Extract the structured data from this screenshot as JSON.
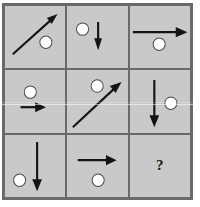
{
  "puzzle": {
    "type": "ravens-progressive-matrix",
    "title": "3x3 visual analogy matrix",
    "rows": 3,
    "columns": 3,
    "background_color": "#c9c9c9",
    "grid_line_color": "#6a6a6a",
    "stroke_color": "#141414",
    "circle_fill_color": "#ffffff",
    "missing_cell_index": 9,
    "missing_cell_label": "?",
    "cells": [
      {
        "index": 1,
        "name": "cell-1",
        "arrow": {
          "direction": "up-right",
          "length": "long",
          "x1": 8,
          "y1": 48,
          "x2": 52,
          "y2": 10
        },
        "circle": {
          "cx": 42,
          "cy": 36,
          "r": 6,
          "position": "lower-right-of-arrow"
        }
      },
      {
        "index": 2,
        "name": "cell-2",
        "arrow": {
          "direction": "down",
          "length": "short",
          "x1": 32,
          "y1": 17,
          "x2": 32,
          "y2": 41
        },
        "circle": {
          "cx": 17,
          "cy": 23,
          "r": 6,
          "position": "left-of-arrow"
        }
      },
      {
        "index": 3,
        "name": "cell-3",
        "arrow": {
          "direction": "right",
          "length": "long",
          "x1": 4,
          "y1": 26,
          "x2": 58,
          "y2": 26
        },
        "circle": {
          "cx": 30,
          "cy": 38,
          "r": 6,
          "position": "below-arrow"
        }
      },
      {
        "index": 4,
        "name": "cell-4",
        "arrow": {
          "direction": "right",
          "length": "short",
          "x1": 16,
          "y1": 37,
          "x2": 40,
          "y2": 37
        },
        "circle": {
          "cx": 26,
          "cy": 22,
          "r": 6,
          "position": "above-arrow"
        }
      },
      {
        "index": 5,
        "name": "cell-5",
        "arrow": {
          "direction": "up-right",
          "length": "long",
          "x1": 8,
          "y1": 55,
          "x2": 54,
          "y2": 14
        },
        "circle": {
          "cx": 31,
          "cy": 17,
          "r": 6,
          "position": "above-left-of-arrowhead"
        }
      },
      {
        "index": 6,
        "name": "cell-6",
        "arrow": {
          "direction": "down",
          "length": "long",
          "x1": 25,
          "y1": 11,
          "x2": 25,
          "y2": 55
        },
        "circle": {
          "cx": 41,
          "cy": 33,
          "r": 6,
          "position": "right-of-arrow"
        }
      },
      {
        "index": 7,
        "name": "cell-7",
        "arrow": {
          "direction": "down",
          "length": "long",
          "x1": 33,
          "y1": 8,
          "x2": 33,
          "y2": 55
        },
        "circle": {
          "cx": 16,
          "cy": 45,
          "r": 6,
          "position": "lower-left-of-arrow"
        }
      },
      {
        "index": 8,
        "name": "cell-8",
        "arrow": {
          "direction": "right",
          "length": "medium",
          "x1": 11,
          "y1": 25,
          "x2": 49,
          "y2": 25
        },
        "circle": {
          "cx": 32,
          "cy": 45,
          "r": 6,
          "position": "below-arrow"
        }
      },
      {
        "index": 9,
        "name": "cell-9-answer",
        "arrow": null,
        "circle": null,
        "label": "?"
      }
    ]
  }
}
